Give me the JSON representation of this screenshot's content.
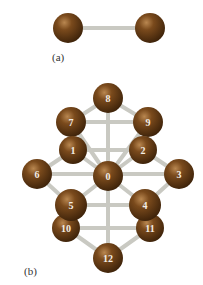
{
  "figure": {
    "part_a": {
      "label": "(a)",
      "atoms": [
        {
          "x": 68,
          "y": 28,
          "label": ""
        },
        {
          "x": 150,
          "y": 28,
          "label": ""
        }
      ],
      "bonds": [
        [
          0,
          1
        ]
      ]
    },
    "part_b": {
      "label": "(b)",
      "atoms": [
        {
          "id": "0",
          "x": 108,
          "y": 176
        },
        {
          "id": "1",
          "x": 73,
          "y": 150
        },
        {
          "id": "2",
          "x": 143,
          "y": 150
        },
        {
          "id": "3",
          "x": 179,
          "y": 174
        },
        {
          "id": "4",
          "x": 145,
          "y": 205
        },
        {
          "id": "5",
          "x": 71,
          "y": 205
        },
        {
          "id": "6",
          "x": 37,
          "y": 174
        },
        {
          "id": "7",
          "x": 71,
          "y": 122
        },
        {
          "id": "8",
          "x": 108,
          "y": 98
        },
        {
          "id": "9",
          "x": 148,
          "y": 122
        },
        {
          "id": "10",
          "x": 66,
          "y": 228
        },
        {
          "id": "11",
          "x": 150,
          "y": 228
        },
        {
          "id": "12",
          "x": 108,
          "y": 258
        }
      ]
    },
    "colors": {
      "atom": "#6b3f14",
      "atom_highlight": "#b07a45",
      "bond": "#c8c8c0",
      "label_text": "#f4eee6"
    }
  }
}
